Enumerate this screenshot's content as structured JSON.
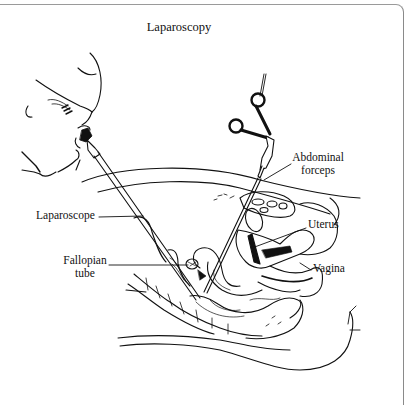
{
  "figure": {
    "title": "Laparoscopy",
    "labels": {
      "abdominal_forceps_line1": "Abdominal",
      "abdominal_forceps_line2": "forceps",
      "laparoscope": "Laparoscope",
      "uterus": "Uterus",
      "fallopian_tube_line1": "Fallopian",
      "fallopian_tube_line2": "tube",
      "vagina": "Vagina"
    },
    "colors": {
      "ink": "#111111",
      "background": "#ffffff",
      "frame": "#8a8a8a"
    }
  }
}
